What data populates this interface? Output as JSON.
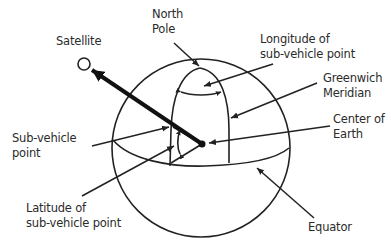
{
  "diagram": {
    "labels": {
      "satellite": [
        "Satellite"
      ],
      "north_pole": [
        "North",
        "Pole"
      ],
      "longitude": [
        "Longitude of",
        "sub-vehicle point"
      ],
      "greenwich": [
        "Greenwich",
        "Meridian"
      ],
      "center": [
        "Center of",
        "Earth"
      ],
      "sub_vehicle": [
        "Sub-vehicle",
        "point"
      ],
      "latitude": [
        "Latitude of",
        "sub-vehicle point"
      ],
      "equator": [
        "Equator"
      ]
    },
    "colors": {
      "line": "#222222",
      "text": "#2b2b2b",
      "background": "#ffffff"
    }
  }
}
